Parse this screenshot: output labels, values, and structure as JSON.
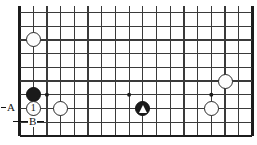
{
  "diagram": {
    "kind": "go-board-diagram",
    "geometry": {
      "origin_x": 19.5,
      "origin_y": 12.5,
      "cell": 13.7,
      "cols": 18,
      "rows": 10,
      "stone_diameter": 15,
      "star_dot_diameter": 4
    },
    "colors": {
      "background": "#ffffff",
      "grid_line": "#3a3a3a",
      "border_line": "#1c1c1c",
      "black_stone": "#1a1a1a",
      "white_stone": "#fdfdfd",
      "stone_outline": "#2a2a2a",
      "marker": "#ffffff",
      "text": "#111111"
    },
    "edges": {
      "left_border": true,
      "bottom_border": true,
      "right_border": true,
      "top_border": false
    },
    "star_points": [
      {
        "col": 2,
        "row": 6
      },
      {
        "col": 8,
        "row": 6
      },
      {
        "col": 14,
        "row": 6
      }
    ],
    "stones": [
      {
        "id": "white-upper-left",
        "name": "white-stone",
        "color": "white",
        "col": 1,
        "row": 2,
        "label": "",
        "mark": ""
      },
      {
        "id": "black-left",
        "name": "black-stone",
        "color": "black",
        "col": 1,
        "row": 6,
        "label": "",
        "mark": ""
      },
      {
        "id": "white-move-1",
        "name": "white-stone-numbered",
        "color": "white",
        "col": 1,
        "row": 7,
        "label": "1",
        "mark": ""
      },
      {
        "id": "white-left-lower",
        "name": "white-stone",
        "color": "white",
        "col": 3,
        "row": 7,
        "label": "",
        "mark": ""
      },
      {
        "id": "black-triangle",
        "name": "black-stone-marked",
        "color": "black",
        "col": 9,
        "row": 7,
        "label": "",
        "mark": "triangle"
      },
      {
        "id": "white-right-upper",
        "name": "white-stone",
        "color": "white",
        "col": 15,
        "row": 5,
        "label": "",
        "mark": ""
      },
      {
        "id": "white-right-lower",
        "name": "white-stone",
        "color": "white",
        "col": 14,
        "row": 7,
        "label": "",
        "mark": ""
      }
    ],
    "annotations": [
      {
        "id": "label-a",
        "name": "point-label-a",
        "text": "A",
        "x": 6,
        "y": 102,
        "leader": {
          "x1": 1,
          "y1": 107,
          "x2": 16,
          "y2": 107
        }
      },
      {
        "id": "label-b",
        "name": "point-label-b",
        "text": "B",
        "x": 28,
        "y": 116,
        "leader": {
          "x1": 13,
          "y1": 121,
          "x2": 44,
          "y2": 121
        }
      }
    ]
  }
}
